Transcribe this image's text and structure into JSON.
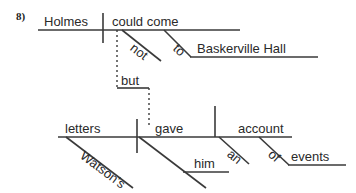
{
  "exercise": {
    "number": "8)"
  },
  "diagram": {
    "type": "reed-kellogg-sentence-diagram",
    "sentence": "Holmes could not come to Baskerville Hall, but Watson's letters gave him an account of events.",
    "line_color": "#3a3a3a",
    "text_color": "#2a2a2a",
    "clauses": [
      {
        "id": "clause-1",
        "subject": "Holmes",
        "verb": "could come",
        "modifiers": [
          {
            "word": "not",
            "attaches_to": "could come",
            "type": "adverb"
          }
        ],
        "prepositional_phrases": [
          {
            "preposition": "to",
            "object": "Baskerville Hall"
          }
        ]
      },
      {
        "id": "clause-2",
        "subject": "letters",
        "verb": "gave",
        "indirect_object": "him",
        "direct_object": "account",
        "modifiers": [
          {
            "word": "Watson's",
            "attaches_to": "letters",
            "type": "possessive"
          },
          {
            "word": "an",
            "attaches_to": "account",
            "type": "article"
          }
        ],
        "prepositional_phrases": [
          {
            "preposition": "of",
            "object": "events"
          }
        ]
      }
    ],
    "conjunction": {
      "word": "but",
      "connects": [
        "clause-1",
        "clause-2"
      ],
      "line_style": "dotted"
    },
    "words": {
      "holmes": "Holmes",
      "could_come": "could come",
      "not": "not",
      "to": "to",
      "baskerville_hall": "Baskerville Hall",
      "but": "but",
      "letters": "letters",
      "watsons": "Watson's",
      "gave": "gave",
      "him": "him",
      "an": "an",
      "account": "account",
      "of": "of",
      "events": "events"
    }
  }
}
